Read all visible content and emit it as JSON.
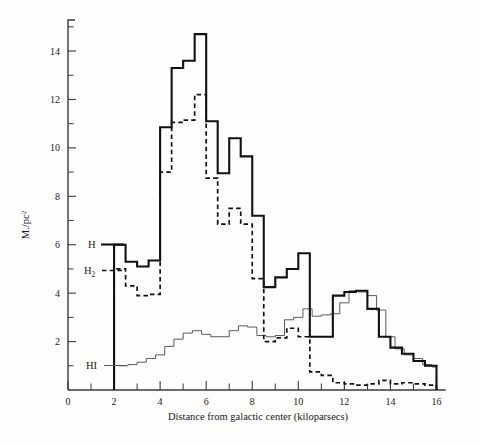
{
  "figure": {
    "background": "#fdfdfb",
    "ink": "#111111"
  },
  "axis": {
    "y_title_main": "M./pc",
    "y_title_exponent": "2",
    "x_title": "Distance from galactic center (kiloparsecs)",
    "x_ticklabels": [
      "0",
      "2",
      "4",
      "6",
      "8",
      "10",
      "12",
      "14",
      "16"
    ],
    "y_ticklabels": [
      "2",
      "4",
      "6",
      "8",
      "10",
      "12",
      "14"
    ]
  },
  "legend": {
    "h_label": "H",
    "h2_label_main": "H",
    "h2_label_sub": "2",
    "hi_label": "HI"
  },
  "chart_data": {
    "type": "line",
    "subtype": "step-histogram",
    "title": "",
    "xlabel": "Distance from galactic center (kiloparsecs)",
    "ylabel": "M./pc^2",
    "xlim": [
      0,
      16.5
    ],
    "ylim": [
      0,
      15.2
    ],
    "xticks": [
      0,
      2,
      4,
      6,
      8,
      10,
      12,
      14,
      16
    ],
    "xticks_minor": [
      1,
      3,
      5,
      7,
      9,
      11,
      13,
      15
    ],
    "yticks": [
      2,
      4,
      6,
      8,
      10,
      12,
      14
    ],
    "yticks_minor": [
      1,
      3,
      5,
      7,
      9,
      11,
      13,
      15
    ],
    "grid": false,
    "legend_position": "inside-left",
    "series": [
      {
        "name": "H",
        "style": "solid-bold",
        "x_edges": [
          2.0,
          2.5,
          3.0,
          3.5,
          4.0,
          4.5,
          5.0,
          5.5,
          6.0,
          6.5,
          7.0,
          7.5,
          8.0,
          8.5,
          9.0,
          9.5,
          10.0,
          10.5,
          11.0,
          11.5,
          12.0,
          12.5,
          13.0,
          13.5,
          14.0,
          14.5,
          15.0,
          15.5,
          16.0
        ],
        "values": [
          6.0,
          5.3,
          5.1,
          5.35,
          10.85,
          13.3,
          13.6,
          14.7,
          11.1,
          8.95,
          10.4,
          9.65,
          7.2,
          4.25,
          4.65,
          5.0,
          5.65,
          2.2,
          2.2,
          3.9,
          4.05,
          4.1,
          3.35,
          2.2,
          1.75,
          1.5,
          1.2,
          1.0
        ]
      },
      {
        "name": "H2",
        "style": "dashed",
        "x_edges": [
          2.0,
          2.5,
          3.0,
          3.5,
          4.0,
          4.5,
          5.0,
          5.5,
          6.0,
          6.5,
          7.0,
          7.5,
          8.0,
          8.5,
          9.0,
          9.5,
          10.0,
          10.5,
          11.0,
          11.5,
          12.0,
          12.5,
          13.0,
          13.5,
          14.0,
          14.5,
          15.0,
          15.5,
          16.0
        ],
        "values": [
          5.0,
          4.3,
          3.9,
          3.95,
          9.0,
          11.05,
          11.15,
          12.2,
          8.75,
          6.85,
          7.5,
          6.85,
          4.6,
          2.0,
          2.15,
          2.55,
          2.2,
          0.75,
          0.6,
          0.3,
          0.25,
          0.2,
          0.25,
          0.4,
          0.25,
          0.3,
          0.25,
          0.2
        ]
      },
      {
        "name": "HI",
        "style": "thin-solid",
        "x_edges": [
          2.2,
          2.6,
          3.0,
          3.4,
          3.8,
          4.2,
          4.6,
          5.0,
          5.4,
          5.8,
          6.2,
          6.6,
          7.0,
          7.4,
          7.8,
          8.2,
          8.6,
          9.0,
          9.4,
          9.8,
          10.2,
          10.6,
          11.0,
          11.4,
          11.8,
          12.2,
          12.6,
          13.0,
          13.4,
          13.8,
          14.2,
          14.6,
          15.0,
          15.4,
          15.8,
          16.0
        ],
        "values": [
          1.0,
          1.05,
          1.15,
          1.3,
          1.45,
          1.8,
          2.1,
          2.35,
          2.45,
          2.3,
          2.2,
          2.2,
          2.45,
          2.65,
          2.6,
          2.25,
          2.2,
          2.25,
          2.9,
          3.0,
          3.35,
          3.05,
          3.1,
          3.15,
          3.6,
          4.1,
          4.05,
          3.9,
          3.3,
          2.2,
          1.7,
          1.45,
          1.3,
          1.05,
          0.95
        ]
      }
    ]
  }
}
